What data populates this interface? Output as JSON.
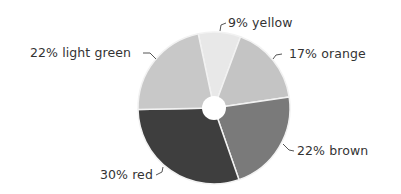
{
  "chart_data": {
    "type": "pie",
    "title": "",
    "donut_hole": true,
    "start_angle_deg": -12,
    "categories": [
      "yellow",
      "orange",
      "brown",
      "red",
      "light green"
    ],
    "values": [
      9,
      17,
      22,
      30,
      22
    ],
    "unit": "%",
    "colors": [
      "#e8e8e8",
      "#c4c4c4",
      "#7a7a7a",
      "#3e3e3e",
      "#c8c8c8"
    ],
    "labels": [
      {
        "text": "9% yellow"
      },
      {
        "text": "17% orange"
      },
      {
        "text": "22% brown"
      },
      {
        "text": "30% red"
      },
      {
        "text": "22% light green"
      }
    ],
    "legend": "none",
    "grid": false
  },
  "colors": {
    "label_text": "#333333",
    "leader_line": "#555555",
    "separator": "#f2f2f2",
    "hole": "#ffffff"
  }
}
